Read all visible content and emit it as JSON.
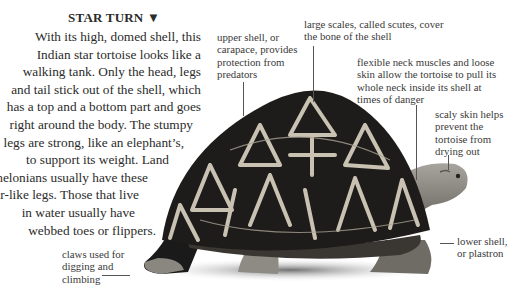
{
  "heading": {
    "title": "STAR TURN",
    "arrow_icon": "down-triangle"
  },
  "body_lines": [
    "With its high, domed shell, this",
    "Indian star tortoise looks like a",
    "walking tank. Only the head, legs",
    "and tail stick out of the shell, which",
    "has a top and a bottom part and goes",
    "right around the body. The stumpy",
    "legs are strong, like an elephant’s,",
    "to support its weight. Land",
    "chelonians usually have these",
    "pillar-like legs. Those that live",
    "in water usually have",
    "webbed toes or flippers."
  ],
  "labels": {
    "carapace": [
      "upper shell, or",
      "carapace, provides",
      "protection from",
      "predators"
    ],
    "scutes": [
      "large scales, called scutes, cover",
      "the bone of the shell"
    ],
    "neck": [
      "flexible neck muscles and loose",
      "skin allow the tortoise to pull its",
      "whole neck inside its shell at",
      "times of danger"
    ],
    "skin": [
      "scaly skin helps",
      "prevent the",
      "tortoise from",
      "drying out"
    ],
    "plastron": [
      "lower shell,",
      "or plastron"
    ],
    "claws": [
      "claws used for",
      "digging and",
      "climbing"
    ]
  },
  "image": {
    "subject": "Indian star tortoise",
    "style": "grayscale photograph"
  }
}
